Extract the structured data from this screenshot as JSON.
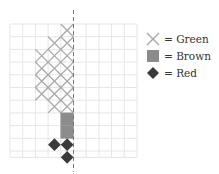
{
  "legend": {
    "items": [
      {
        "symbol": "x-mark",
        "label": "= Green"
      },
      {
        "symbol": "square",
        "label": "= Brown"
      },
      {
        "symbol": "diamond",
        "label": "= Red"
      }
    ]
  },
  "colors": {
    "grid": "#e6e6e6",
    "green_mark": "#a8a8a8",
    "brown_fill": "#8c8c8c",
    "red_fill": "#3a3a3a",
    "dashed_line": "#777777",
    "text": "#333333"
  },
  "grid": {
    "columns": 10,
    "rows": 10.5,
    "origin_x": 10,
    "origin_y": 24,
    "cell_size": 12.7,
    "dashed_line_column_boundary": 5
  },
  "cells": {
    "green": [
      [
        4,
        0
      ],
      [
        3,
        1
      ],
      [
        4,
        1
      ],
      [
        2,
        2
      ],
      [
        3,
        2
      ],
      [
        4,
        2
      ],
      [
        2,
        3
      ],
      [
        3,
        3
      ],
      [
        4,
        3
      ],
      [
        2,
        4
      ],
      [
        3,
        4
      ],
      [
        4,
        4
      ],
      [
        2,
        5
      ],
      [
        3,
        5
      ],
      [
        4,
        5
      ],
      [
        3,
        6
      ],
      [
        4,
        6
      ]
    ],
    "brown": [
      [
        4,
        7
      ],
      [
        4,
        8
      ]
    ],
    "red": [
      [
        3,
        9
      ],
      [
        4,
        9
      ],
      [
        4,
        10
      ]
    ]
  }
}
